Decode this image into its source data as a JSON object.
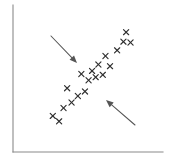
{
  "figure": {
    "background_color": "#ffffff",
    "width": 174,
    "height": 162
  },
  "axes": {
    "name": "scatter-axes",
    "color": "#8a8a8a",
    "y_axis": {
      "x": 13,
      "y_top": 5,
      "y_bottom": 152
    },
    "x_axis": {
      "y": 152,
      "x_left": 13,
      "x_right": 163
    },
    "grid": false,
    "ticks": false,
    "tick_labels": false
  },
  "annotations": [
    {
      "name": "spread-arrow-upper-left",
      "label": "",
      "direction": "down-right",
      "color": "#555555",
      "from": {
        "x": 51,
        "y": 36
      },
      "to": {
        "x": 77,
        "y": 63
      }
    },
    {
      "name": "spread-arrow-lower-right",
      "label": "",
      "direction": "up-left",
      "color": "#555555",
      "from": {
        "x": 135,
        "y": 125
      },
      "to": {
        "x": 106,
        "y": 100
      }
    }
  ],
  "chart_data": {
    "type": "scatter",
    "title": "",
    "subtitle": "",
    "xlabel": "",
    "ylabel": "",
    "marker": "x",
    "marker_color": "#2e2e2e",
    "grid": false,
    "legend": false,
    "legend_position": "none",
    "xlim": [
      0,
      100
    ],
    "ylim": [
      0,
      100
    ],
    "series": [
      {
        "name": "observations",
        "points": [
          {
            "x": 20.0,
            "y": 15.6
          },
          {
            "x": 24.7,
            "y": 10.9
          },
          {
            "x": 28.0,
            "y": 22.4
          },
          {
            "x": 34.0,
            "y": 27.2
          },
          {
            "x": 38.7,
            "y": 32.7
          },
          {
            "x": 30.7,
            "y": 39.5
          },
          {
            "x": 44.0,
            "y": 36.7
          },
          {
            "x": 46.7,
            "y": 46.3
          },
          {
            "x": 41.3,
            "y": 51.7
          },
          {
            "x": 52.0,
            "y": 49.0
          },
          {
            "x": 49.3,
            "y": 54.4
          },
          {
            "x": 57.3,
            "y": 51.0
          },
          {
            "x": 54.0,
            "y": 59.9
          },
          {
            "x": 62.7,
            "y": 58.5
          },
          {
            "x": 59.3,
            "y": 67.3
          },
          {
            "x": 68.0,
            "y": 72.1
          },
          {
            "x": 72.7,
            "y": 79.6
          },
          {
            "x": 78.0,
            "y": 78.9
          },
          {
            "x": 74.7,
            "y": 87.8
          }
        ]
      }
    ]
  }
}
